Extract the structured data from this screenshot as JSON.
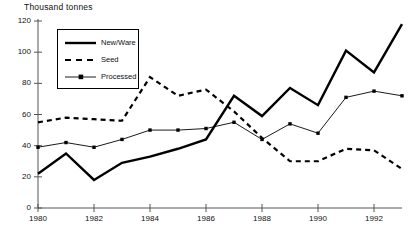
{
  "chart_data": {
    "type": "line",
    "title": "Thousand tonnes",
    "xlabel": "",
    "ylabel": "Thousand tonnes",
    "xlim": [
      1980,
      1993
    ],
    "ylim": [
      0,
      120
    ],
    "yticks": [
      0,
      20,
      40,
      60,
      80,
      100,
      120
    ],
    "ytick_labels": [
      "0",
      "20",
      "40",
      "60",
      "80",
      "100",
      "120"
    ],
    "xticks": [
      1980,
      1982,
      1984,
      1986,
      1988,
      1990,
      1992
    ],
    "xtick_labels": [
      "1980",
      "1982",
      "1984",
      "1986",
      "1988",
      "1990",
      "1992"
    ],
    "grid": false,
    "legend_position": "upper-left-inside",
    "x": [
      1980,
      1981,
      1982,
      1983,
      1984,
      1985,
      1986,
      1987,
      1988,
      1989,
      1990,
      1991,
      1992,
      1993
    ],
    "series": [
      {
        "name": "New/Ware",
        "style": "solid-thick",
        "marker": "none",
        "color": "#000000",
        "values": [
          22,
          35,
          18,
          29,
          33,
          38,
          44,
          72,
          59,
          77,
          66,
          101,
          87,
          118
        ]
      },
      {
        "name": "Seed",
        "style": "dashed",
        "marker": "none",
        "color": "#000000",
        "values": [
          55,
          58,
          57,
          56,
          84,
          72,
          76,
          62,
          45,
          30,
          30,
          38,
          37,
          25
        ]
      },
      {
        "name": "Processed",
        "style": "solid-thin-markers",
        "marker": "square",
        "color": "#000000",
        "values": [
          39,
          42,
          39,
          44,
          50,
          50,
          51,
          55,
          44,
          54,
          48,
          71,
          75,
          72
        ]
      }
    ]
  },
  "legend": {
    "items": [
      {
        "label": "New/Ware",
        "sample": "solid-thick-line-sample"
      },
      {
        "label": "Seed",
        "sample": "dashed-line-sample"
      },
      {
        "label": "Processed",
        "sample": "thin-line-marker-sample"
      }
    ]
  }
}
